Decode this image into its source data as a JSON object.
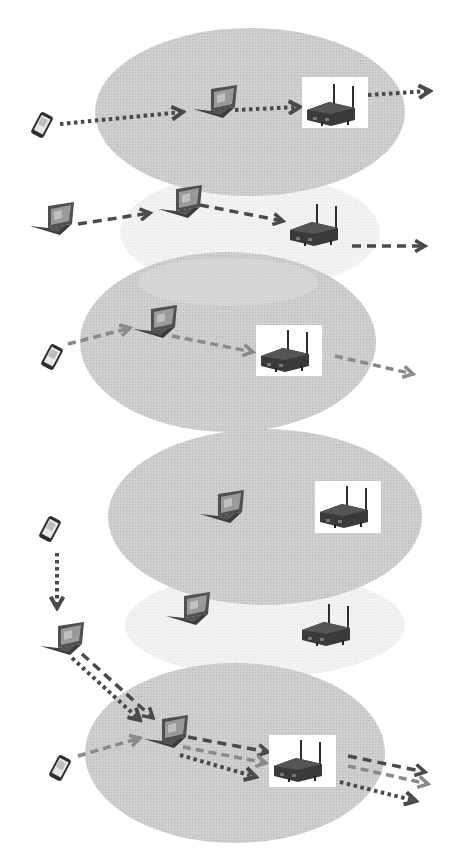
{
  "diagram": {
    "type": "wireless-network-topology",
    "colors": {
      "ellipse_fill": "#c8c8c8",
      "ellipse_faded": "#ececec",
      "arrow_dark": "#4a4a4a",
      "arrow_mid": "#8a8a8a",
      "device_dark": "#2e2e2e",
      "screen": "#9a9a9a"
    },
    "panels": [
      {
        "id": "panel-1",
        "ellipse": {
          "cx": 250,
          "cy": 112,
          "rx": 155,
          "ry": 84,
          "style": "filled"
        },
        "devices": [
          {
            "type": "phone",
            "x": 42,
            "y": 125
          },
          {
            "type": "laptop",
            "x": 215,
            "y": 105
          },
          {
            "type": "router",
            "x": 335,
            "y": 103,
            "boxed": true
          }
        ],
        "arrows": [
          {
            "from": [
              60,
              124
            ],
            "to": [
              183,
              112
            ],
            "style": "dotted",
            "color": "dark"
          },
          {
            "from": [
              235,
              110
            ],
            "to": [
              303,
              107
            ],
            "style": "dotted",
            "color": "dark"
          },
          {
            "from": [
              368,
              95
            ],
            "to": [
              430,
              91
            ],
            "style": "dotted",
            "color": "dark"
          }
        ]
      },
      {
        "id": "panel-2",
        "ellipse": {
          "cx": 250,
          "cy": 232,
          "rx": 130,
          "ry": 58,
          "style": "faded"
        },
        "devices": [
          {
            "type": "laptop",
            "x": 50,
            "y": 222
          },
          {
            "type": "laptop",
            "x": 178,
            "y": 205
          },
          {
            "type": "router",
            "x": 318,
            "y": 228,
            "boxed": false
          }
        ],
        "arrows": [
          {
            "from": [
              78,
              224
            ],
            "to": [
              150,
              213
            ],
            "style": "dashed",
            "color": "dark"
          },
          {
            "from": [
              200,
              205
            ],
            "to": [
              285,
              221
            ],
            "style": "dashed",
            "color": "dark"
          },
          {
            "from": [
              352,
              246
            ],
            "to": [
              428,
              246
            ],
            "style": "dashed",
            "color": "dark"
          }
        ]
      },
      {
        "id": "panel-3",
        "ellipse": {
          "cx": 228,
          "cy": 342,
          "rx": 148,
          "ry": 90,
          "style": "filled"
        },
        "devices": [
          {
            "type": "phone",
            "x": 52,
            "y": 357
          },
          {
            "type": "laptop",
            "x": 155,
            "y": 325
          },
          {
            "type": "router",
            "x": 288,
            "y": 350,
            "boxed": true
          }
        ],
        "arrows": [
          {
            "from": [
              68,
              344
            ],
            "to": [
              130,
              328
            ],
            "style": "dashed",
            "color": "mid"
          },
          {
            "from": [
              172,
              336
            ],
            "to": [
              255,
              352
            ],
            "style": "dashed",
            "color": "mid"
          },
          {
            "from": [
              335,
              356
            ],
            "to": [
              415,
              374
            ],
            "style": "dashed",
            "color": "mid"
          }
        ]
      },
      {
        "id": "panel-4",
        "ellipse": {
          "cx": 265,
          "cy": 517,
          "rx": 157,
          "ry": 88,
          "style": "filled"
        },
        "devices": [
          {
            "type": "laptop",
            "x": 222,
            "y": 510
          },
          {
            "type": "router",
            "x": 348,
            "y": 510,
            "boxed": true
          },
          {
            "type": "phone",
            "x": 50,
            "y": 529
          }
        ],
        "arrows": []
      },
      {
        "id": "panel-5",
        "ellipse": {
          "cx": 265,
          "cy": 625,
          "rx": 140,
          "ry": 52,
          "style": "faded"
        },
        "devices": [
          {
            "type": "laptop",
            "x": 186,
            "y": 612
          },
          {
            "type": "router",
            "x": 330,
            "y": 625,
            "boxed": false
          },
          {
            "type": "laptop",
            "x": 60,
            "y": 640
          }
        ],
        "arrows": [
          {
            "from": [
              57,
              553
            ],
            "to": [
              57,
              610
            ],
            "style": "dotted",
            "color": "dark"
          }
        ]
      },
      {
        "id": "panel-6",
        "ellipse": {
          "cx": 235,
          "cy": 753,
          "rx": 150,
          "ry": 90,
          "style": "filled"
        },
        "devices": [
          {
            "type": "phone",
            "x": 60,
            "y": 768
          },
          {
            "type": "laptop",
            "x": 165,
            "y": 735
          },
          {
            "type": "router",
            "x": 302,
            "y": 760,
            "boxed": true
          }
        ],
        "arrows": [
          {
            "from": [
              82,
              654
            ],
            "to": [
              155,
              720
            ],
            "style": "dashed",
            "color": "dark"
          },
          {
            "from": [
              72,
              658
            ],
            "to": [
              142,
              722
            ],
            "style": "dotted",
            "color": "dark"
          },
          {
            "from": [
              78,
              756
            ],
            "to": [
              142,
              738
            ],
            "style": "dashed",
            "color": "mid"
          },
          {
            "from": [
              188,
              737
            ],
            "to": [
              270,
              752
            ],
            "style": "dashed",
            "color": "dark"
          },
          {
            "from": [
              183,
              747
            ],
            "to": [
              268,
              763
            ],
            "style": "dashed",
            "color": "mid"
          },
          {
            "from": [
              180,
              755
            ],
            "to": [
              258,
              777
            ],
            "style": "dotted",
            "color": "dark"
          },
          {
            "from": [
              348,
              756
            ],
            "to": [
              427,
              772
            ],
            "style": "dashed",
            "color": "dark"
          },
          {
            "from": [
              348,
              766
            ],
            "to": [
              430,
              784
            ],
            "style": "dashed",
            "color": "mid"
          },
          {
            "from": [
              340,
              782
            ],
            "to": [
              418,
              801
            ],
            "style": "dotted",
            "color": "dark"
          }
        ]
      }
    ]
  }
}
